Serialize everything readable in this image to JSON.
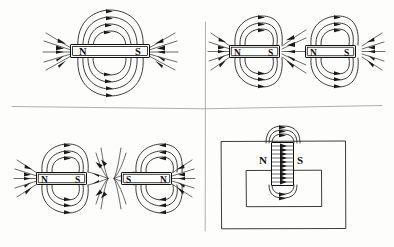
{
  "figure": {
    "background_color": "#fdfdfc",
    "ink_color": "#1a1a1a",
    "divider_color": "#9a9a9a",
    "width": 394,
    "height": 247
  },
  "panels": [
    {
      "id": "panel-single-bar-magnet",
      "quadrant": "top-left",
      "description": "Single bar magnet with surrounding field loops",
      "magnets": [
        {
          "name": "bar-magnet",
          "orientation": "horizontal",
          "left_pole": "N",
          "right_pole": "S"
        }
      ],
      "neutral_point": false,
      "field_direction": "loops leave N and return to S"
    },
    {
      "id": "panel-attracting-magnets",
      "quadrant": "top-right",
      "description": "Two bar magnets with unlike poles facing, field lines bridge the gap",
      "magnets": [
        {
          "name": "left-bar-magnet",
          "orientation": "horizontal",
          "left_pole": "N",
          "right_pole": "S"
        },
        {
          "name": "right-bar-magnet",
          "orientation": "horizontal",
          "left_pole": "N",
          "right_pole": "S"
        }
      ],
      "neutral_point": false,
      "field_direction": "lines cross the gap from N to S"
    },
    {
      "id": "panel-repelling-magnets",
      "quadrant": "bottom-left",
      "description": "Two bar magnets with like poles facing, neutral point between them",
      "magnets": [
        {
          "name": "left-bar-magnet",
          "orientation": "horizontal",
          "left_pole": "N",
          "right_pole": "S"
        },
        {
          "name": "right-bar-magnet",
          "orientation": "horizontal",
          "left_pole": "S",
          "right_pole": "N"
        }
      ],
      "neutral_point": true,
      "field_direction": "lines splay away from the gap forming a neutral point"
    },
    {
      "id": "panel-magnet-in-frame",
      "quadrant": "bottom-right",
      "description": "Vertical magnet between nested rectangular frames with horizontal field lines",
      "magnets": [
        {
          "name": "vertical-magnet",
          "orientation": "vertical",
          "left_pole": "N",
          "right_pole": "S"
        }
      ],
      "frames": [
        "outer-rectangle",
        "inner-rectangle"
      ],
      "neutral_point": false,
      "field_direction": "straight arrows run left to right from N to S"
    }
  ],
  "pole_labels": {
    "north": "N",
    "south": "S"
  }
}
